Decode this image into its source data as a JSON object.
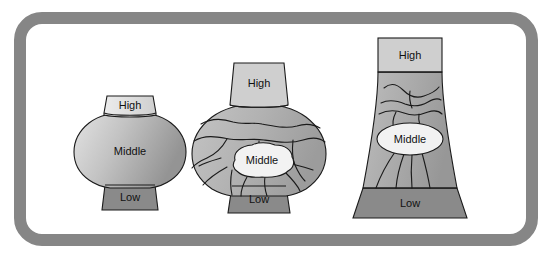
{
  "figure": {
    "name": "social-stratification-shapes-diagram",
    "frame": {
      "name": "rounded-rectangle-border",
      "color": "#868686",
      "fill": "#ffffff",
      "stroke_width": 12,
      "corner_radius": 22
    },
    "tier_names": {
      "high": "High",
      "middle": "Middle",
      "low": "Low"
    },
    "colors": {
      "high_fill": "#d2d2d2",
      "middle_fill_light": "#c9c9c9",
      "middle_fill_mid": "#a8a8a8",
      "middle_fill_dark": "#8f8f8f",
      "low_fill": "#8a8a8a",
      "callout_fill": "#f2f2f2",
      "outline": "#1a1a1a",
      "crack": "#1a1a1a",
      "text": "#111111"
    },
    "shapes": [
      {
        "id": "shape-1",
        "name": "onion-vase-intact",
        "label_high": "High",
        "label_middle": "Middle",
        "label_low": "Low",
        "cracked": false,
        "middle_label_style": "plain"
      },
      {
        "id": "shape-2",
        "name": "onion-vase-cracked",
        "label_high": "High",
        "label_middle": "Middle",
        "label_low": "Low",
        "cracked": true,
        "middle_label_style": "callout"
      },
      {
        "id": "shape-3",
        "name": "trapezoid-cooling-tower-cracked",
        "label_high": "High",
        "label_middle": "Middle",
        "label_low": "Low",
        "cracked": true,
        "middle_label_style": "ellipse"
      }
    ]
  }
}
